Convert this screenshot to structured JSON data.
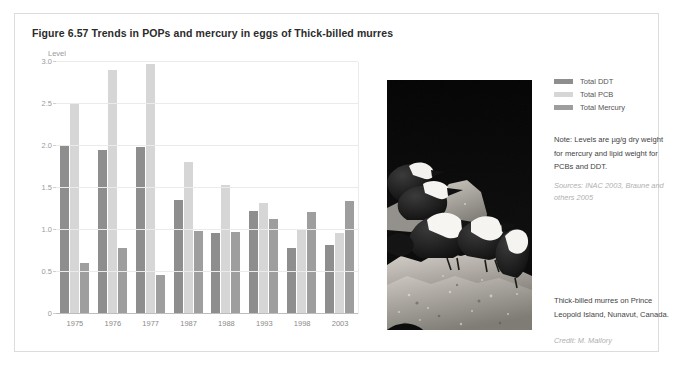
{
  "figure": {
    "title": "Figure 6.57 Trends in POPs and mercury in eggs of Thick-billed murres"
  },
  "legend": {
    "items": [
      {
        "label": "Total DDT",
        "color": "#8e8e8e"
      },
      {
        "label": "Total PCB",
        "color": "#d6d6d6"
      },
      {
        "label": "Total Mercury",
        "color": "#9e9e9e"
      }
    ]
  },
  "note": {
    "text": "Note: Levels are µg/g dry weight for mercury and lipid weight for PCBs and DDT."
  },
  "sources": {
    "text": "Sources: INAC 2003, Braune and others 2005"
  },
  "photo": {
    "alt": "photograph-thick-billed-murres-on-rock"
  },
  "caption": {
    "text": "Thick-billed murres on Prince Leopold Island, Nunavut, Canada."
  },
  "credit": {
    "text": "Credit: M. Mallory"
  },
  "chart_data": {
    "type": "bar",
    "title": "Trends in POPs and mercury in eggs of Thick-billed murres",
    "xlabel": "",
    "ylabel": "Level",
    "ylim": [
      0,
      3.0
    ],
    "yticks": [
      0,
      0.5,
      1.0,
      1.5,
      2.0,
      2.5,
      3.0
    ],
    "ytick_labels": [
      "0",
      "0.5",
      "1.0",
      "1.5",
      "2.0",
      "2.5",
      "3.0"
    ],
    "grid": true,
    "legend_position": "right",
    "categories": [
      "1975",
      "1976",
      "1977",
      "1987",
      "1988",
      "1993",
      "1998",
      "2003"
    ],
    "series": [
      {
        "name": "Total DDT",
        "color": "#8e8e8e",
        "values": [
          2.01,
          1.95,
          1.99,
          1.36,
          0.97,
          1.23,
          0.78,
          0.82
        ]
      },
      {
        "name": "Total PCB",
        "color": "#d6d6d6",
        "values": [
          2.5,
          2.9,
          2.98,
          1.81,
          1.53,
          1.32,
          1.0,
          0.97
        ]
      },
      {
        "name": "Total Mercury",
        "color": "#9e9e9e",
        "values": [
          0.61,
          0.79,
          0.47,
          0.99,
          0.98,
          1.13,
          1.21,
          1.34
        ]
      }
    ]
  }
}
